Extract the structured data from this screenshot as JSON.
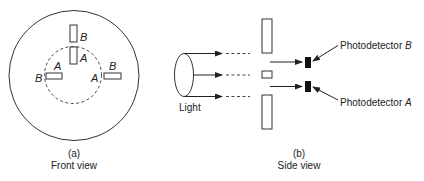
{
  "front_view": {
    "caption_letter": "(a)",
    "caption_title": "Front view",
    "labels": {
      "top_B": "B",
      "top_A": "A",
      "left_outer": "B",
      "left_inner": "A",
      "right_inner": "A",
      "right_outer": "B"
    }
  },
  "side_view": {
    "caption_letter": "(b)",
    "caption_title": "Side view",
    "light_label": "Light",
    "detector_B_prefix": "Photodetector ",
    "detector_B_letter": "B",
    "detector_A_prefix": "Photodetector ",
    "detector_A_letter": "A"
  },
  "colors": {
    "line": "#333333",
    "detector_fill": "#111111",
    "background": "#ffffff"
  }
}
